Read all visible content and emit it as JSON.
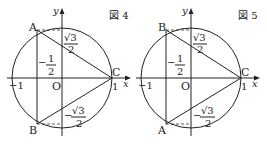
{
  "figures": [
    {
      "title": "図 4",
      "points": {
        "top": "A",
        "bottom": "B",
        "right": "C"
      },
      "origin": "O",
      "axis_x": "x",
      "axis_y": "y",
      "tick_neg1": "−1",
      "tick_1": "1",
      "label_top_frac": {
        "sign": "",
        "num": "√3",
        "den": "2"
      },
      "label_half": {
        "sign": "−",
        "num": "1",
        "den": "2"
      },
      "label_bottom_frac": {
        "sign": "−",
        "num": "√3",
        "den": "2"
      }
    },
    {
      "title": "図 5",
      "points": {
        "top": "B",
        "bottom": "A",
        "right": "C"
      },
      "origin": "O",
      "axis_x": "x",
      "axis_y": "y",
      "tick_neg1": "−1",
      "tick_1": "1",
      "label_top_frac": {
        "sign": "",
        "num": "√3",
        "den": "2"
      },
      "label_half": {
        "sign": "−",
        "num": "1",
        "den": "2"
      },
      "label_bottom_frac": {
        "sign": "−",
        "num": "√3",
        "den": "2"
      }
    }
  ]
}
